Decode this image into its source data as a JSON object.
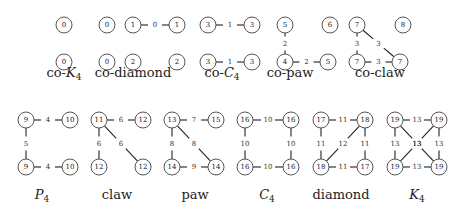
{
  "graphs": [
    {
      "caption": "co-K4",
      "cap": [
        64,
        73
      ],
      "nodes": [
        {
          "x": 64,
          "y": 25,
          "l": "0"
        },
        {
          "x": 64,
          "y": 62,
          "l": "0"
        }
      ],
      "edges": []
    },
    {
      "caption": "co-diamond",
      "cap": [
        133,
        73
      ],
      "nodes": [
        {
          "x": 107,
          "y": 25,
          "l": "0"
        },
        {
          "x": 133,
          "y": 25,
          "l": "1"
        },
        {
          "x": 177,
          "y": 25,
          "l": "1"
        },
        {
          "x": 107,
          "y": 62,
          "l": "0"
        },
        {
          "x": 133,
          "y": 62,
          "l": "2"
        },
        {
          "x": 177,
          "y": 62,
          "l": "2"
        }
      ],
      "edges": [
        {
          "a": 1,
          "b": 2,
          "l": "0"
        }
      ]
    },
    {
      "caption": "co-C4",
      "cap": [
        222,
        73
      ],
      "nodes": [
        {
          "x": 208,
          "y": 25,
          "l": "3"
        },
        {
          "x": 252,
          "y": 25,
          "l": "3"
        },
        {
          "x": 208,
          "y": 62,
          "l": "3"
        },
        {
          "x": 252,
          "y": 62,
          "l": "3"
        }
      ],
      "edges": [
        {
          "a": 0,
          "b": 1,
          "l": "1"
        },
        {
          "a": 2,
          "b": 3,
          "l": "1"
        }
      ]
    },
    {
      "caption": "co-paw",
      "cap": [
        290,
        73
      ],
      "nodes": [
        {
          "x": 285,
          "y": 25,
          "l": "5"
        },
        {
          "x": 330,
          "y": 25,
          "l": "6"
        },
        {
          "x": 285,
          "y": 62,
          "l": "4"
        },
        {
          "x": 328,
          "y": 62,
          "l": "5"
        }
      ],
      "edges": [
        {
          "a": 0,
          "b": 2,
          "l": "2"
        },
        {
          "a": 2,
          "b": 3,
          "l": "2"
        }
      ]
    },
    {
      "caption": "co-claw",
      "cap": [
        380,
        73
      ],
      "nodes": [
        {
          "x": 357,
          "y": 25,
          "l": "7"
        },
        {
          "x": 403,
          "y": 25,
          "l": "8"
        },
        {
          "x": 357,
          "y": 62,
          "l": "7"
        },
        {
          "x": 400,
          "y": 62,
          "l": "7"
        }
      ],
      "edges": [
        {
          "a": 0,
          "b": 2,
          "l": "3"
        },
        {
          "a": 2,
          "b": 3,
          "l": "3"
        },
        {
          "a": 0,
          "b": 3,
          "l": "3"
        }
      ]
    },
    {
      "caption": "P4",
      "cap": [
        42,
        195
      ],
      "nodes": [
        {
          "x": 26,
          "y": 120,
          "l": "9"
        },
        {
          "x": 70,
          "y": 120,
          "l": "10"
        },
        {
          "x": 26,
          "y": 167,
          "l": "9"
        },
        {
          "x": 70,
          "y": 167,
          "l": "10"
        }
      ],
      "edges": [
        {
          "a": 0,
          "b": 1,
          "l": "4"
        },
        {
          "a": 0,
          "b": 2,
          "l": "5"
        },
        {
          "a": 2,
          "b": 3,
          "l": "4"
        }
      ]
    },
    {
      "caption": "claw",
      "cap": [
        117,
        195
      ],
      "nodes": [
        {
          "x": 99,
          "y": 120,
          "l": "11"
        },
        {
          "x": 143,
          "y": 120,
          "l": "12"
        },
        {
          "x": 99,
          "y": 167,
          "l": "12"
        },
        {
          "x": 143,
          "y": 167,
          "l": "12"
        }
      ],
      "edges": [
        {
          "a": 0,
          "b": 1,
          "l": "6"
        },
        {
          "a": 0,
          "b": 2,
          "l": "6"
        },
        {
          "a": 0,
          "b": 3,
          "l": "6"
        }
      ]
    },
    {
      "caption": "paw",
      "cap": [
        195,
        195
      ],
      "nodes": [
        {
          "x": 172,
          "y": 120,
          "l": "13"
        },
        {
          "x": 216,
          "y": 120,
          "l": "15"
        },
        {
          "x": 172,
          "y": 167,
          "l": "14"
        },
        {
          "x": 216,
          "y": 167,
          "l": "14"
        }
      ],
      "edges": [
        {
          "a": 0,
          "b": 1,
          "l": "7"
        },
        {
          "a": 0,
          "b": 2,
          "l": "8"
        },
        {
          "a": 0,
          "b": 3,
          "l": "8"
        },
        {
          "a": 2,
          "b": 3,
          "l": "9"
        }
      ]
    },
    {
      "caption": "C4",
      "cap": [
        267,
        195
      ],
      "nodes": [
        {
          "x": 245,
          "y": 120,
          "l": "16"
        },
        {
          "x": 291,
          "y": 120,
          "l": "16"
        },
        {
          "x": 245,
          "y": 167,
          "l": "16"
        },
        {
          "x": 291,
          "y": 167,
          "l": "16"
        }
      ],
      "edges": [
        {
          "a": 0,
          "b": 1,
          "l": "10"
        },
        {
          "a": 0,
          "b": 2,
          "l": "10"
        },
        {
          "a": 1,
          "b": 3,
          "l": "10"
        },
        {
          "a": 2,
          "b": 3,
          "l": "10"
        }
      ]
    },
    {
      "caption": "diamond",
      "cap": [
        341,
        195
      ],
      "nodes": [
        {
          "x": 321,
          "y": 120,
          "l": "17"
        },
        {
          "x": 365,
          "y": 120,
          "l": "18"
        },
        {
          "x": 321,
          "y": 167,
          "l": "18"
        },
        {
          "x": 365,
          "y": 167,
          "l": "17"
        }
      ],
      "edges": [
        {
          "a": 0,
          "b": 1,
          "l": "11"
        },
        {
          "a": 0,
          "b": 2,
          "l": "11"
        },
        {
          "a": 1,
          "b": 3,
          "l": "11"
        },
        {
          "a": 2,
          "b": 3,
          "l": "11"
        },
        {
          "a": 1,
          "b": 2,
          "l": "12"
        }
      ]
    },
    {
      "caption": "K4",
      "cap": [
        417,
        195
      ],
      "nodes": [
        {
          "x": 395,
          "y": 120,
          "l": "19"
        },
        {
          "x": 439,
          "y": 120,
          "l": "19"
        },
        {
          "x": 395,
          "y": 167,
          "l": "19"
        },
        {
          "x": 439,
          "y": 167,
          "l": "19"
        }
      ],
      "edges": [
        {
          "a": 0,
          "b": 1,
          "l": "13"
        },
        {
          "a": 0,
          "b": 2,
          "l": "13"
        },
        {
          "a": 1,
          "b": 3,
          "l": "13"
        },
        {
          "a": 2,
          "b": 3,
          "l": "13"
        },
        {
          "a": 0,
          "b": 3,
          "l": "13"
        },
        {
          "a": 1,
          "b": 2,
          "l": "13"
        }
      ]
    }
  ]
}
